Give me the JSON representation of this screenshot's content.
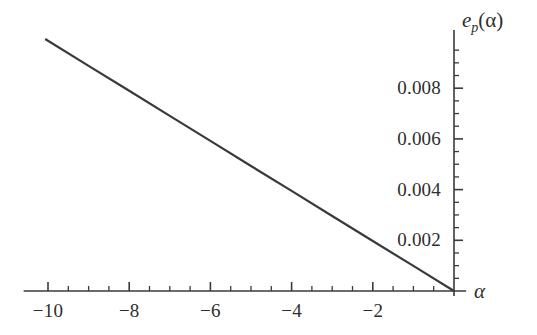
{
  "figure": {
    "background_color": "#ffffff",
    "ink_color": "#3a3a3a",
    "width": 537,
    "height": 335
  },
  "axis_labels": {
    "x_name": "α",
    "y_name_base": "e",
    "y_name_sub": "p",
    "y_name_arg": "(α)"
  },
  "chart_data": {
    "type": "line",
    "title": "",
    "subtitle": "",
    "xlabel": "α",
    "ylabel": "e_p(α)",
    "xlim": [
      -10.6,
      0.3
    ],
    "ylim": [
      -0.0002,
      0.0103
    ],
    "grid": false,
    "legend": null,
    "legend_position": "none",
    "axis_style": "cross-origin-spines",
    "x_ticks_major": [
      -10,
      -8,
      -6,
      -4,
      -2
    ],
    "x_tick_labels": [
      "-10",
      "-8",
      "-6",
      "-4",
      "-2"
    ],
    "x_minor_step": 0.5,
    "x_minor_range": [
      -10,
      0
    ],
    "y_ticks_major": [
      0.002,
      0.004,
      0.006,
      0.008
    ],
    "y_tick_labels": [
      "0.002",
      "0.004",
      "0.006",
      "0.008"
    ],
    "y_minor_step": 0.0005,
    "y_minor_range": [
      0,
      0.0095
    ],
    "series": [
      {
        "name": "e_p(α)",
        "color": "#3a3a3a",
        "line_width": 2.2,
        "x": [
          -10.07,
          -9,
          -8,
          -7,
          -6,
          -5,
          -4,
          -3,
          -2,
          -1,
          0
        ],
        "values": [
          0.00994,
          0.00888,
          0.0079,
          0.00691,
          0.00592,
          0.00493,
          0.00395,
          0.00296,
          0.00197,
          0.00099,
          0.0
        ],
        "slope": -0.000987,
        "intercept": 0.0
      }
    ]
  }
}
